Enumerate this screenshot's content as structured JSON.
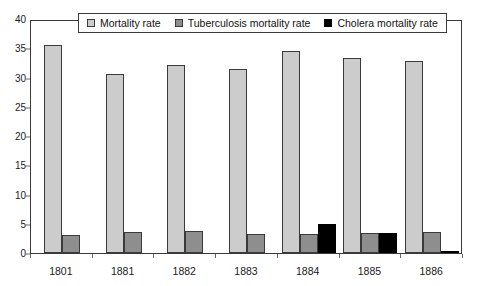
{
  "chart_data": {
    "type": "bar",
    "title": "",
    "xlabel": "",
    "ylabel": "",
    "ylim": [
      0,
      40
    ],
    "ytick_step": 5,
    "yticks": [
      0,
      5,
      10,
      15,
      20,
      25,
      30,
      35,
      40
    ],
    "grid": false,
    "legend_position": "top-center",
    "categories": [
      "1801",
      "1881",
      "1882",
      "1883",
      "1884",
      "1885",
      "1886"
    ],
    "series": [
      {
        "name": "Mortality rate",
        "color": "#cccccc",
        "values": [
          35.6,
          30.6,
          32.1,
          31.4,
          34.6,
          33.4,
          32.8
        ]
      },
      {
        "name": "Tuberculosis mortality rate",
        "color": "#8e8e8e",
        "values": [
          3.0,
          3.6,
          3.7,
          3.3,
          3.3,
          3.5,
          3.6
        ]
      },
      {
        "name": "Cholera mortality rate",
        "color": "#000000",
        "values": [
          0,
          0,
          0,
          0,
          5.0,
          3.5,
          0.3
        ]
      }
    ]
  },
  "legend": {
    "items": [
      {
        "label": "Mortality rate",
        "series": "mortality"
      },
      {
        "label": "Tuberculosis mortality rate",
        "series": "tuberculosis"
      },
      {
        "label": "Cholera mortality rate",
        "series": "cholera"
      }
    ]
  }
}
